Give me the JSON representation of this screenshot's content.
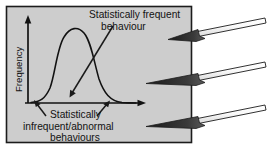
{
  "figure": {
    "type": "statistical-distribution-diagram",
    "panel": {
      "background_color": "#cdcdcd",
      "border_color": "#1c1c1c"
    },
    "axes": {
      "y_axis_label": "Frequency",
      "x_axis_label": "",
      "axis_color": "#121212"
    },
    "curve": {
      "name": "normal-distribution-curve",
      "color": "#121212"
    },
    "annotations": [
      {
        "name": "frequent-behaviour-label",
        "lines": [
          "Statistically frequent",
          "behaviour"
        ],
        "points_to": "curve-peak"
      },
      {
        "name": "infrequent-behaviour-label",
        "lines": [
          "Statistically",
          "infrequent/abnormal",
          "behaviours"
        ],
        "points_to": "curve-tails"
      }
    ],
    "external_arrows": {
      "name": "pointer-arrows",
      "count": 3,
      "direction": "left",
      "fill_color": "#ffffff",
      "outline_color": "#1c1c1c"
    }
  }
}
